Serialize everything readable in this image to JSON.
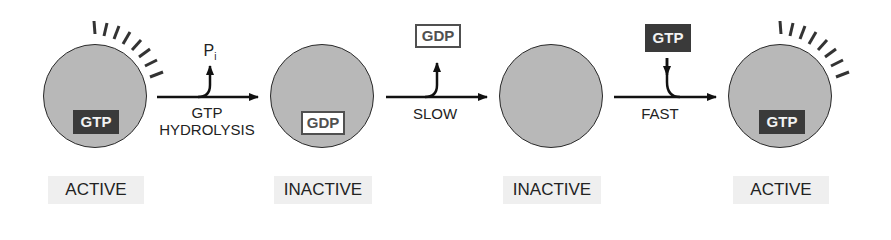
{
  "diagram": {
    "stages": [
      {
        "state": "ACTIVE",
        "nucleotide": "GTP",
        "nucleotide_style": "dark"
      },
      {
        "state": "INACTIVE",
        "nucleotide": "GDP",
        "nucleotide_style": "outlined"
      },
      {
        "state": "INACTIVE",
        "nucleotide": ""
      },
      {
        "state": "ACTIVE",
        "nucleotide": "GTP",
        "nucleotide_style": "dark"
      }
    ],
    "transitions": [
      {
        "label_line1": "GTP",
        "label_line2": "HYDROLYSIS",
        "released": "P",
        "released_sub": "i"
      },
      {
        "label": "SLOW",
        "released": "GDP"
      },
      {
        "label": "FAST",
        "added": "GTP"
      }
    ]
  }
}
